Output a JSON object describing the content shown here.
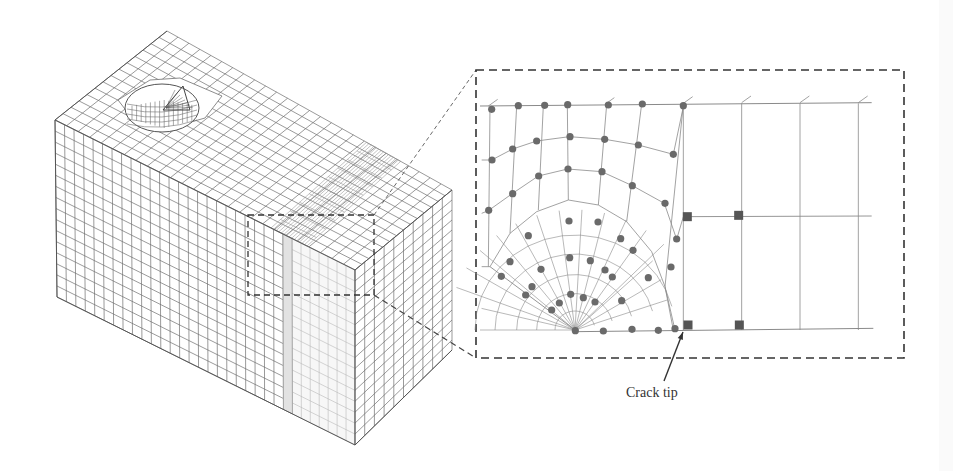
{
  "figure": {
    "annotation": {
      "label": "Crack tip",
      "arrow_from": [
        664,
        381
      ],
      "arrow_to": [
        683,
        332
      ]
    },
    "inset": {
      "box": {
        "x": 476,
        "y": 70,
        "width": 428,
        "height": 288
      },
      "stroke": "#333333",
      "dash": "8 5"
    },
    "source_box": {
      "x": 248,
      "y": 215,
      "width": 126,
      "height": 80
    },
    "colors": {
      "mesh": "#6e6e6e",
      "mesh_light": "#b9b9b9",
      "node_circle": "#6a6a6a",
      "node_square": "#555555",
      "background": "#ffffff"
    },
    "node_legend": {
      "circle_nodes": "crack-tip region nodes",
      "square_nodes": "enriched/transition element nodes"
    }
  }
}
